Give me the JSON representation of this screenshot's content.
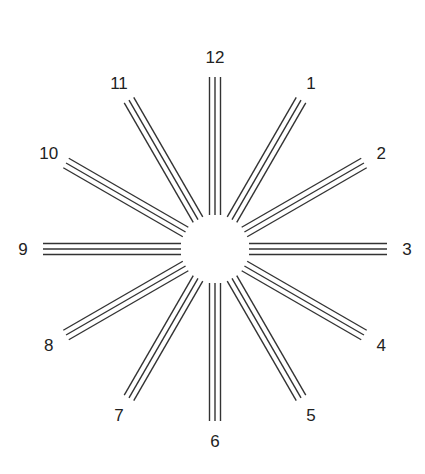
{
  "diagram": {
    "center": {
      "x": 215,
      "y": 249
    },
    "inner_radius": 34,
    "outer_radius": 172,
    "label_radius": 192,
    "line_spacing": 5.5,
    "lines_per_spoke": 3,
    "line_color": "#333333",
    "spokes": [
      {
        "hour": 12,
        "label": "12"
      },
      {
        "hour": 1,
        "label": "1"
      },
      {
        "hour": 2,
        "label": "2"
      },
      {
        "hour": 3,
        "label": "3"
      },
      {
        "hour": 4,
        "label": "4"
      },
      {
        "hour": 5,
        "label": "5"
      },
      {
        "hour": 6,
        "label": "6"
      },
      {
        "hour": 7,
        "label": "7"
      },
      {
        "hour": 8,
        "label": "8"
      },
      {
        "hour": 9,
        "label": "9"
      },
      {
        "hour": 10,
        "label": "10"
      },
      {
        "hour": 11,
        "label": "11"
      }
    ]
  }
}
